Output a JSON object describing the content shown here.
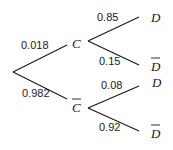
{
  "diagram": {
    "type": "probability-tree",
    "root": {
      "branches": [
        {
          "event": "C",
          "complement": false,
          "probability": "0.018",
          "branches": [
            {
              "event": "D",
              "complement": false,
              "probability": "0.85"
            },
            {
              "event": "D",
              "complement": true,
              "probability": "0.15"
            }
          ]
        },
        {
          "event": "C",
          "complement": true,
          "probability": "0.982",
          "branches": [
            {
              "event": "D",
              "complement": false,
              "probability": "0.08"
            },
            {
              "event": "D",
              "complement": true,
              "probability": "0.92"
            }
          ]
        }
      ]
    },
    "labels": {
      "p_c": "0.018",
      "p_not_c": "0.982",
      "p_d_given_c": "0.85",
      "p_not_d_given_c": "0.15",
      "p_d_given_not_c": "0.08",
      "p_not_d_given_not_c": "0.92",
      "node_c": "C",
      "node_not_c": "C",
      "leaf_d_1": "D",
      "leaf_not_d_1": "D",
      "leaf_d_2": "D",
      "leaf_not_d_2": "D"
    },
    "colors": {
      "line": "#1a1a1a",
      "background": "#ffffff"
    }
  }
}
